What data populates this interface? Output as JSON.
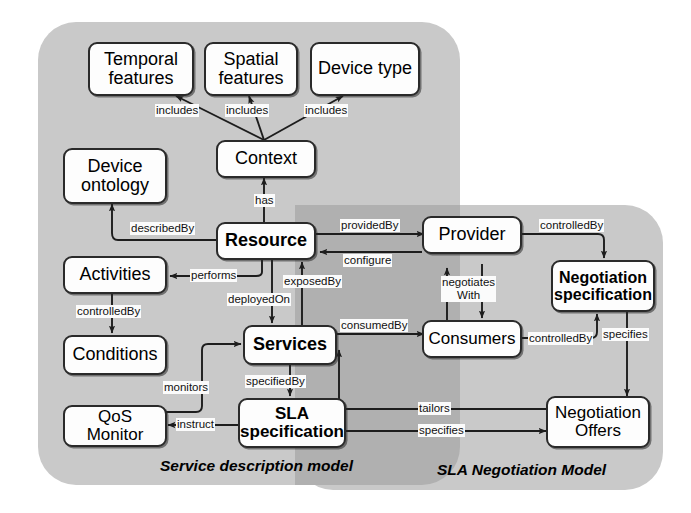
{
  "diagram": {
    "panels": [
      {
        "id": "service-description",
        "caption": "Service description model"
      },
      {
        "id": "sla-negotiation",
        "caption": "SLA Negotiation Model"
      }
    ],
    "colors": {
      "panel_fill": "#c9c9c9",
      "panel_overlap_fill": "#b0b0b0",
      "node_fill": "#fdfdfd",
      "node_border": "#2a2a2a",
      "text": "#000000"
    },
    "nodes": [
      {
        "id": "temporal-features",
        "label": "Temporal\nfeatures",
        "emphasis": "normal"
      },
      {
        "id": "spatial-features",
        "label": "Spatial\nfeatures",
        "emphasis": "normal"
      },
      {
        "id": "device-type",
        "label": "Device type",
        "emphasis": "normal"
      },
      {
        "id": "context",
        "label": "Context",
        "emphasis": "normal"
      },
      {
        "id": "device-ontology",
        "label": "Device\nontology",
        "emphasis": "normal"
      },
      {
        "id": "resource",
        "label": "Resource",
        "emphasis": "bold"
      },
      {
        "id": "activities",
        "label": "Activities",
        "emphasis": "normal"
      },
      {
        "id": "conditions",
        "label": "Conditions",
        "emphasis": "normal"
      },
      {
        "id": "services",
        "label": "Services",
        "emphasis": "bold"
      },
      {
        "id": "qos-monitor",
        "label": "QoS Monitor",
        "emphasis": "normal"
      },
      {
        "id": "sla-specification",
        "label": "SLA\nspecification",
        "emphasis": "bold"
      },
      {
        "id": "provider",
        "label": "Provider",
        "emphasis": "normal"
      },
      {
        "id": "consumers",
        "label": "Consumers",
        "emphasis": "normal"
      },
      {
        "id": "negotiation-specification",
        "label": "Negotiation\nspecification",
        "emphasis": "bold"
      },
      {
        "id": "negotiation-offers",
        "label": "Negotiation\nOffers",
        "emphasis": "normal"
      }
    ],
    "edges": [
      {
        "id": "context-temporal",
        "from": "context",
        "to": "temporal-features",
        "label": "includes"
      },
      {
        "id": "context-spatial",
        "from": "context",
        "to": "spatial-features",
        "label": "includes"
      },
      {
        "id": "context-devicetype",
        "from": "context",
        "to": "device-type",
        "label": "includes"
      },
      {
        "id": "resource-context",
        "from": "resource",
        "to": "context",
        "label": "has"
      },
      {
        "id": "resource-ontology",
        "from": "resource",
        "to": "device-ontology",
        "label": "describedBy"
      },
      {
        "id": "resource-activities",
        "from": "resource",
        "to": "activities",
        "label": "performs"
      },
      {
        "id": "activities-conditions",
        "from": "activities",
        "to": "conditions",
        "label": "controlledBy"
      },
      {
        "id": "resource-services",
        "from": "resource",
        "to": "services",
        "label": "exposedOn"
      },
      {
        "id": "services-resource",
        "from": "services",
        "to": "resource",
        "label": "exposedBy"
      },
      {
        "id": "services-sla",
        "from": "services",
        "to": "sla-specification",
        "label": "specifiedBy"
      },
      {
        "id": "sla-qos",
        "from": "sla-specification",
        "to": "qos-monitor",
        "label": "instruct"
      },
      {
        "id": "qos-services",
        "from": "qos-monitor",
        "to": "services",
        "label": "monitors"
      },
      {
        "id": "resource-provider",
        "from": "resource",
        "to": "provider",
        "label": "providedBy"
      },
      {
        "id": "provider-resource",
        "from": "provider",
        "to": "resource",
        "label": "configure"
      },
      {
        "id": "services-consumers",
        "from": "services",
        "to": "consumers",
        "label": "consumedBy"
      },
      {
        "id": "provider-consumers",
        "from": "provider",
        "to": "consumers",
        "label": "negotiates\nWith"
      },
      {
        "id": "provider-negspec",
        "from": "provider",
        "to": "negotiation-specification",
        "label": "controlledBy"
      },
      {
        "id": "consumers-negspec",
        "from": "consumers",
        "to": "negotiation-specification",
        "label": "controlledBy"
      },
      {
        "id": "negspec-offers",
        "from": "negotiation-specification",
        "to": "negotiation-offers",
        "label": "specifies"
      },
      {
        "id": "offers-services",
        "from": "negotiation-offers",
        "to": "services",
        "label": "tailors"
      },
      {
        "id": "sla-offers",
        "from": "sla-specification",
        "to": "negotiation-offers",
        "label": "specifies"
      }
    ],
    "edge_label_text": {
      "includes_1": "includes",
      "includes_2": "includes",
      "includes_3": "includes",
      "has": "has",
      "describedBy": "describedBy",
      "performs": "performs",
      "controlledBy_activities": "controlledBy",
      "deployedOn": "deployedOn",
      "exposedBy": "exposedBy",
      "specifiedBy": "specifiedBy",
      "instruct": "instruct",
      "monitors": "monitors",
      "providedBy": "providedBy",
      "configure": "configure",
      "consumedBy": "consumedBy",
      "negotiatesWith": "negotiates\nWith",
      "controlledBy_provider": "controlledBy",
      "controlledBy_consumers": "controlledBy",
      "specifies_negspec": "specifies",
      "tailors": "tailors",
      "specifies_sla": "specifies"
    },
    "node_labels": {
      "temporal_features": "Temporal\nfeatures",
      "spatial_features": "Spatial\nfeatures",
      "device_type": "Device type",
      "context": "Context",
      "device_ontology": "Device\nontology",
      "resource": "Resource",
      "activities": "Activities",
      "conditions": "Conditions",
      "services": "Services",
      "qos_monitor": "QoS Monitor",
      "sla_specification": "SLA\nspecification",
      "provider": "Provider",
      "consumers": "Consumers",
      "negotiation_specification": "Negotiation\nspecification",
      "negotiation_offers": "Negotiation\nOffers"
    },
    "captions": {
      "left": "Service description model",
      "right": "SLA Negotiation Model"
    }
  }
}
